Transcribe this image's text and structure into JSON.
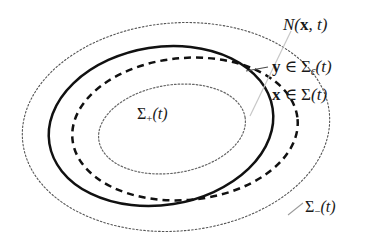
{
  "figure": {
    "background_color": "#ffffff",
    "ink_color": "#1a1a1a",
    "faint_color": "#b8b8b8"
  },
  "labels": {
    "neighborhood": {
      "name": "N(x, t)",
      "function": "N",
      "open_paren": "(",
      "arg1": "x",
      "comma": ", ",
      "arg2": "t",
      "close_paren": ")"
    },
    "y_member": {
      "name": "y ∈ Σε(t)",
      "point": "y",
      "member": "∈",
      "set": "Σ",
      "subscript": "ε",
      "open_paren": "(",
      "arg": "t",
      "close_paren": ")"
    },
    "x_member": {
      "name": "x ∈ Σ(t)",
      "point": "x",
      "member": "∈",
      "set": "Σ",
      "open_paren": "(",
      "arg": "t",
      "close_paren": ")"
    },
    "sigma_plus": {
      "name": "Σ+(t)",
      "set": "Σ",
      "subscript": "+",
      "open_paren": "(",
      "arg": "t",
      "close_paren": ")"
    },
    "sigma_minus": {
      "name": "Σ−(t)",
      "set": "Σ",
      "subscript": "−",
      "open_paren": "(",
      "arg": "t",
      "close_paren": ")"
    }
  },
  "curves": {
    "outer_dotted": {
      "name": "outer-boundary-sigma-minus",
      "style": "dotted",
      "stroke": "#555555",
      "width": 1.1,
      "cx": 176,
      "cy": 127,
      "rx": 154,
      "ry": 105,
      "rotate": -5
    },
    "solid": {
      "name": "level-set-sigma",
      "style": "solid",
      "stroke": "#111111",
      "width": 2.4,
      "cx": 163,
      "cy": 126,
      "rx": 112,
      "ry": 78,
      "rotate": -8
    },
    "dashed": {
      "name": "epsilon-level-set-sigma-epsilon",
      "style": "dashed",
      "stroke": "#111111",
      "width": 2.4,
      "dasharray": "7,5",
      "cx": 183,
      "cy": 128,
      "rx": 112,
      "ry": 72,
      "rotate": -6
    },
    "inner_dotted": {
      "name": "inner-region-sigma-plus",
      "style": "dotted",
      "stroke": "#666666",
      "width": 1.1,
      "cx": 172,
      "cy": 129,
      "rx": 74,
      "ry": 44,
      "rotate": -9
    },
    "leader_line": {
      "name": "leader-line-to-x",
      "style": "faint-solid",
      "stroke": "#c0c0c0",
      "width": 1.0,
      "x1": 288,
      "y1": 33,
      "x2": 252,
      "y2": 110
    },
    "leader_tick_y": {
      "name": "leader-tick-to-y",
      "stroke": "#555555",
      "width": 1.0,
      "x1": 248,
      "y1": 70,
      "x2": 268,
      "y2": 67
    }
  }
}
